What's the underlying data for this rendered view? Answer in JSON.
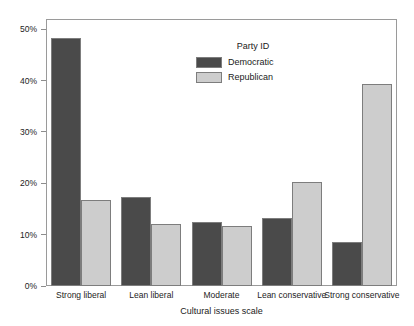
{
  "chart_data": {
    "type": "bar",
    "title": "",
    "xlabel": "Cultural issues scale",
    "ylabel": "",
    "categories": [
      "Strong liberal",
      "Lean liberal",
      "Moderate",
      "Lean conservative",
      "Strong conservative"
    ],
    "series": [
      {
        "name": "Democratic",
        "color": "#4a4a4a",
        "values": [
          48.3,
          17.4,
          12.4,
          13.2,
          8.6
        ]
      },
      {
        "name": "Republican",
        "color": "#cdcdcd",
        "values": [
          16.8,
          12.1,
          11.6,
          20.3,
          39.3
        ]
      }
    ],
    "ylim": [
      0,
      52
    ],
    "yticks": [
      0,
      10,
      20,
      30,
      40,
      50
    ],
    "ytick_labels": [
      "0%",
      "10%",
      "20%",
      "30%",
      "40%",
      "50%"
    ],
    "grid": false,
    "legend": {
      "title": "Party ID",
      "position": "inside-top-center",
      "entries": [
        "Democratic",
        "Republican"
      ]
    }
  }
}
